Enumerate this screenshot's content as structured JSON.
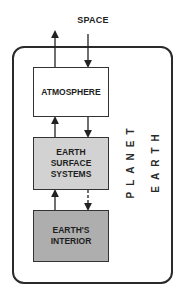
{
  "diagram": {
    "top_label": "SPACE",
    "container_label": {
      "line1": "PLANET",
      "line2": "EARTH"
    },
    "boxes": [
      {
        "id": "atmosphere",
        "lines": [
          "ATMOSPHERE"
        ],
        "fill": "#ffffff"
      },
      {
        "id": "earth-surface-systems",
        "lines": [
          "EARTH",
          "SURFACE",
          "SYSTEMS"
        ],
        "fill": "#d2d2d2"
      },
      {
        "id": "earths-interior",
        "lines": [
          "EARTH'S",
          "INTERIOR"
        ],
        "fill": "#aeaeae"
      }
    ],
    "arrows": [
      {
        "from": "atmosphere",
        "to": "space",
        "style": "solid"
      },
      {
        "from": "space",
        "to": "atmosphere",
        "style": "solid"
      },
      {
        "from": "earth-surface-systems",
        "to": "atmosphere",
        "style": "solid"
      },
      {
        "from": "atmosphere",
        "to": "earth-surface-systems",
        "style": "solid"
      },
      {
        "from": "earths-interior",
        "to": "earth-surface-systems",
        "style": "solid"
      },
      {
        "from": "earth-surface-systems",
        "to": "earths-interior",
        "style": "dashed"
      }
    ]
  }
}
